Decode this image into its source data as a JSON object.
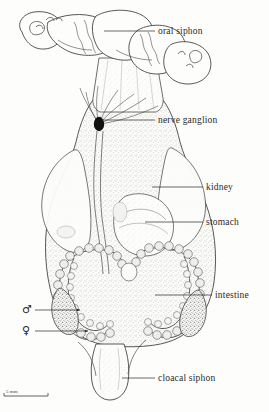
{
  "figure": {
    "background_color": "#fdfdfc",
    "ink_color": "#2a2a2a",
    "width": 269,
    "height": 412
  },
  "labels": [
    {
      "id": "oral-siphon",
      "text": "oral siphon",
      "x": 158,
      "y": 27,
      "leader_from_x": 155,
      "leader_to_x": 104,
      "leader_y": 31
    },
    {
      "id": "nerve-ganglion",
      "text": "nerve ganglion",
      "x": 158,
      "y": 116,
      "leader_from_x": 155,
      "leader_to_x": 101,
      "leader_y": 120
    },
    {
      "id": "kidney",
      "text": "kidney",
      "x": 206,
      "y": 183,
      "leader_from_x": 203,
      "leader_to_x": 152,
      "leader_y": 187
    },
    {
      "id": "stomach",
      "text": "stomach",
      "x": 206,
      "y": 218,
      "leader_from_x": 203,
      "leader_to_x": 145,
      "leader_y": 222
    },
    {
      "id": "intestine",
      "text": "intestine",
      "x": 215,
      "y": 291,
      "leader_from_x": 212,
      "leader_to_x": 155,
      "leader_y": 295
    },
    {
      "id": "cloacal-siphon",
      "text": "cloacal siphon",
      "x": 158,
      "y": 374,
      "leader_from_x": 155,
      "leader_to_x": 122,
      "leader_y": 378
    }
  ],
  "gonad_symbols": [
    {
      "id": "male-gonad",
      "symbol": "♂",
      "name": "male-symbol",
      "x": 22,
      "y": 304,
      "leader_from_x": 35,
      "leader_to_x": 80,
      "leader_y": 310
    },
    {
      "id": "female-gonad",
      "symbol": "♀",
      "name": "female-symbol",
      "x": 22,
      "y": 325,
      "leader_from_x": 35,
      "leader_to_x": 88,
      "leader_y": 331
    }
  ],
  "scale_bar": {
    "text": "5 mm",
    "x": 6,
    "y": 389,
    "bar_x": 4,
    "bar_y": 396,
    "bar_width": 44
  }
}
